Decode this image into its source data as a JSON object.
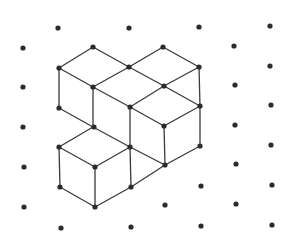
{
  "figure": {
    "width": 296,
    "height": 240,
    "background": "#ffffff",
    "dot_color": "#2b2b2b",
    "dot_radius": 2.6,
    "line_color": "#3a3a3a",
    "line_width": 1.3
  },
  "grid_dots": [
    [
      23,
      48
    ],
    [
      23,
      87
    ],
    [
      23,
      127
    ],
    [
      24,
      167
    ],
    [
      24,
      207
    ],
    [
      58,
      28
    ],
    [
      59,
      68
    ],
    [
      59,
      108
    ],
    [
      59,
      147
    ],
    [
      60,
      187
    ],
    [
      61,
      228
    ],
    [
      93,
      47
    ],
    [
      93,
      87
    ],
    [
      94,
      127
    ],
    [
      95,
      167
    ],
    [
      95,
      207
    ],
    [
      129,
      28
    ],
    [
      129,
      67
    ],
    [
      130,
      107
    ],
    [
      130,
      147
    ],
    [
      131,
      187
    ],
    [
      131,
      227
    ],
    [
      163,
      47
    ],
    [
      164,
      86
    ],
    [
      164,
      126
    ],
    [
      165,
      165
    ],
    [
      165,
      205
    ],
    [
      199,
      27
    ],
    [
      199,
      67
    ],
    [
      200,
      106
    ],
    [
      200,
      146
    ],
    [
      201,
      186
    ],
    [
      201,
      226
    ],
    [
      234,
      46
    ],
    [
      235,
      85
    ],
    [
      235,
      125
    ],
    [
      236,
      164
    ],
    [
      236,
      204
    ],
    [
      270,
      26
    ],
    [
      270,
      66
    ],
    [
      271,
      105
    ],
    [
      271,
      145
    ],
    [
      272,
      185
    ],
    [
      272,
      225
    ]
  ],
  "cube_edges": [
    [
      [
        59,
        68
      ],
      [
        93,
        47
      ]
    ],
    [
      [
        93,
        47
      ],
      [
        129,
        67
      ]
    ],
    [
      [
        59,
        68
      ],
      [
        93,
        87
      ]
    ],
    [
      [
        93,
        87
      ],
      [
        129,
        67
      ]
    ],
    [
      [
        129,
        67
      ],
      [
        163,
        47
      ]
    ],
    [
      [
        163,
        47
      ],
      [
        199,
        67
      ]
    ],
    [
      [
        129,
        67
      ],
      [
        164,
        86
      ]
    ],
    [
      [
        164,
        86
      ],
      [
        199,
        67
      ]
    ],
    [
      [
        59,
        68
      ],
      [
        59,
        108
      ]
    ],
    [
      [
        93,
        87
      ],
      [
        93,
        127
      ]
    ],
    [
      [
        59,
        108
      ],
      [
        93,
        127
      ]
    ],
    [
      [
        93,
        87
      ],
      [
        130,
        107
      ]
    ],
    [
      [
        164,
        86
      ],
      [
        130,
        107
      ]
    ],
    [
      [
        164,
        86
      ],
      [
        200,
        106
      ]
    ],
    [
      [
        199,
        67
      ],
      [
        200,
        106
      ]
    ],
    [
      [
        130,
        107
      ],
      [
        164,
        126
      ]
    ],
    [
      [
        200,
        106
      ],
      [
        164,
        126
      ]
    ],
    [
      [
        130,
        107
      ],
      [
        130,
        147
      ]
    ],
    [
      [
        164,
        126
      ],
      [
        165,
        165
      ]
    ],
    [
      [
        200,
        106
      ],
      [
        200,
        146
      ]
    ],
    [
      [
        200,
        146
      ],
      [
        165,
        165
      ]
    ],
    [
      [
        93,
        127
      ],
      [
        59,
        147
      ]
    ],
    [
      [
        93,
        127
      ],
      [
        130,
        147
      ]
    ],
    [
      [
        130,
        147
      ],
      [
        165,
        165
      ]
    ],
    [
      [
        59,
        147
      ],
      [
        95,
        167
      ]
    ],
    [
      [
        95,
        167
      ],
      [
        130,
        147
      ]
    ],
    [
      [
        59,
        147
      ],
      [
        60,
        187
      ]
    ],
    [
      [
        95,
        167
      ],
      [
        95,
        207
      ]
    ],
    [
      [
        130,
        147
      ],
      [
        131,
        187
      ]
    ],
    [
      [
        60,
        187
      ],
      [
        95,
        207
      ]
    ],
    [
      [
        95,
        207
      ],
      [
        131,
        187
      ]
    ],
    [
      [
        131,
        187
      ],
      [
        165,
        165
      ]
    ]
  ]
}
